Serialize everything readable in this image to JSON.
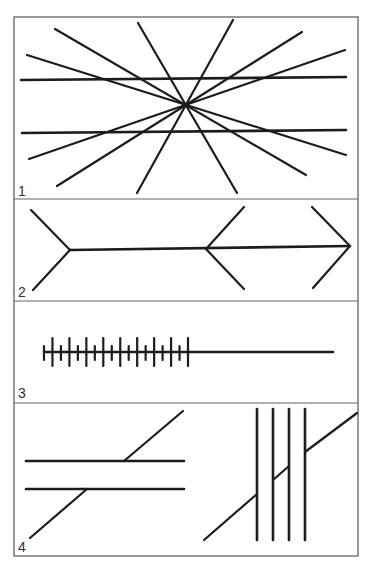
{
  "figure": {
    "colors": {
      "ink": "#1c1c1c",
      "frame": "#555555",
      "background": "#ffffff"
    },
    "frame": {
      "x1": 14,
      "y1": 17,
      "x2": 358,
      "y2": 556
    },
    "dividers": [
      199,
      301,
      403
    ],
    "panels": [
      {
        "number": "1",
        "name": "Hering illusion",
        "label_pos": [
          18,
          196
        ],
        "horizontals": [
          [
            21,
            80,
            346,
            77
          ],
          [
            22,
            133,
            346,
            130
          ]
        ],
        "rays": [
          [
            55,
            29,
            306,
            175
          ],
          [
            27,
            55,
            346,
            155
          ],
          [
            138,
            23,
            237,
            193
          ],
          [
            233,
            20,
            137,
            193
          ],
          [
            302,
            32,
            57,
            186
          ],
          [
            345,
            50,
            29,
            159
          ]
        ]
      },
      {
        "number": "2",
        "name": "Muller-Lyer illusion",
        "label_pos": [
          18,
          297
        ],
        "shaft": [
          70,
          250,
          350,
          246
        ],
        "fins": [
          [
            70,
            250,
            31,
            210
          ],
          [
            70,
            250,
            33,
            290
          ],
          [
            206,
            249,
            244,
            207
          ],
          [
            206,
            249,
            244,
            289
          ],
          [
            350,
            246,
            312,
            207
          ],
          [
            350,
            246,
            313,
            288
          ]
        ]
      },
      {
        "number": "3",
        "name": "Oppel-Kundt illusion",
        "label_pos": [
          18,
          398
        ],
        "line": [
          44,
          352,
          333,
          352
        ],
        "ticks": {
          "start_x": 44,
          "end_x": 188,
          "count": 18,
          "long": [
            338,
            366
          ],
          "short": [
            346,
            360
          ]
        }
      },
      {
        "number": "4",
        "name": "Poggendorff illusion",
        "label_pos": [
          18,
          552
        ],
        "left": {
          "horizontals": [
            [
              26,
              461,
              184,
              461
            ],
            [
              26,
              489,
              184,
              489
            ]
          ],
          "diagonals": [
            [
              124,
              461,
              183,
              411
            ],
            [
              30,
              538,
              87,
              489
            ]
          ]
        },
        "right": {
          "verticals": [
            257,
            273,
            289,
            305
          ],
          "vertical_span": [
            409,
            540
          ],
          "diagonals": [
            [
              204,
              540,
              257,
              494
            ],
            [
              273,
              480,
              289,
              466
            ],
            [
              305,
              452,
              357,
              413
            ]
          ]
        }
      }
    ]
  }
}
